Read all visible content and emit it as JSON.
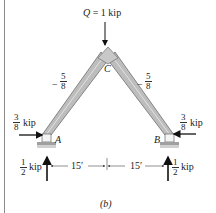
{
  "figure": {
    "caption": "(b)",
    "load": {
      "symbol": "Q",
      "text": "= 1 kip"
    },
    "joints": {
      "apex": "C",
      "left": "A",
      "right": "B"
    },
    "members": [
      {
        "name": "AC",
        "force_sign": "−",
        "force_num": "5",
        "force_den": "8"
      },
      {
        "name": "BC",
        "force_sign": "−",
        "force_num": "5",
        "force_den": "8"
      }
    ],
    "reactions": {
      "A_horizontal": {
        "num": "3",
        "den": "8",
        "unit": "kip"
      },
      "B_horizontal": {
        "num": "3",
        "den": "8",
        "unit": "kip"
      },
      "A_vertical": {
        "num": "1",
        "den": "2",
        "unit": "kip"
      },
      "B_vertical": {
        "num": "1",
        "den": "2",
        "unit": "kip"
      }
    },
    "dimensions": [
      {
        "label": "15′"
      },
      {
        "label": "15′"
      }
    ],
    "colors": {
      "member_fill": "#b9b9b9",
      "member_edge": "#6e6e6e",
      "arrow": "#111111",
      "support_base": "#9a9a9a"
    }
  }
}
